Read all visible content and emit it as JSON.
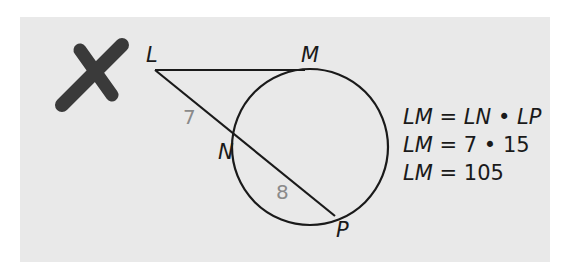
{
  "diagram": {
    "mark": {
      "icon": "cross-mark-icon",
      "color": "#3a3a3a",
      "meaning": "incorrect"
    },
    "points": {
      "L": {
        "label": "L",
        "x": 155,
        "y": 70
      },
      "M": {
        "label": "M",
        "x": 305,
        "y": 70
      },
      "N": {
        "label": "N",
        "x": 240,
        "y": 139
      },
      "P": {
        "label": "P",
        "x": 335,
        "y": 216
      }
    },
    "circle": {
      "cx": 310,
      "cy": 147,
      "r": 78
    },
    "segments": {
      "LN": {
        "label": "7"
      },
      "NP": {
        "label": "8"
      }
    },
    "work": [
      {
        "lhs": "LM",
        "op": "=",
        "rhs": "LN • LP"
      },
      {
        "lhs": "LM",
        "op": "=",
        "rhs": "7 • 15"
      },
      {
        "lhs": "LM",
        "op": "=",
        "rhs": "105"
      }
    ],
    "colors": {
      "panel": "#e9e9e9",
      "stroke": "#1a1a1a",
      "segment_label": "#8a8a8a"
    }
  }
}
